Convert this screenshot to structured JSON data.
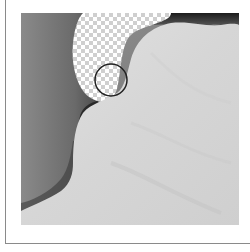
{
  "image": {
    "subject": "close-up of a light grey scalloped/wavy surface against a dark grey background",
    "overlay": {
      "transparency_region": "checkerboard (transparent) region at top-center",
      "brush_cursor": "circle outline"
    },
    "colors": {
      "background_dark": "#5a5a5a",
      "background_mid": "#8e8e8e",
      "surface_light": "#d8d8d8",
      "surface_highlight": "#e6e6e6",
      "edge_shadow": "#1e1e1e",
      "checker_light": "#ffffff",
      "checker_dark": "#cccccc",
      "cursor_stroke": "#222222",
      "frame_line": "#8a8a8a"
    }
  }
}
